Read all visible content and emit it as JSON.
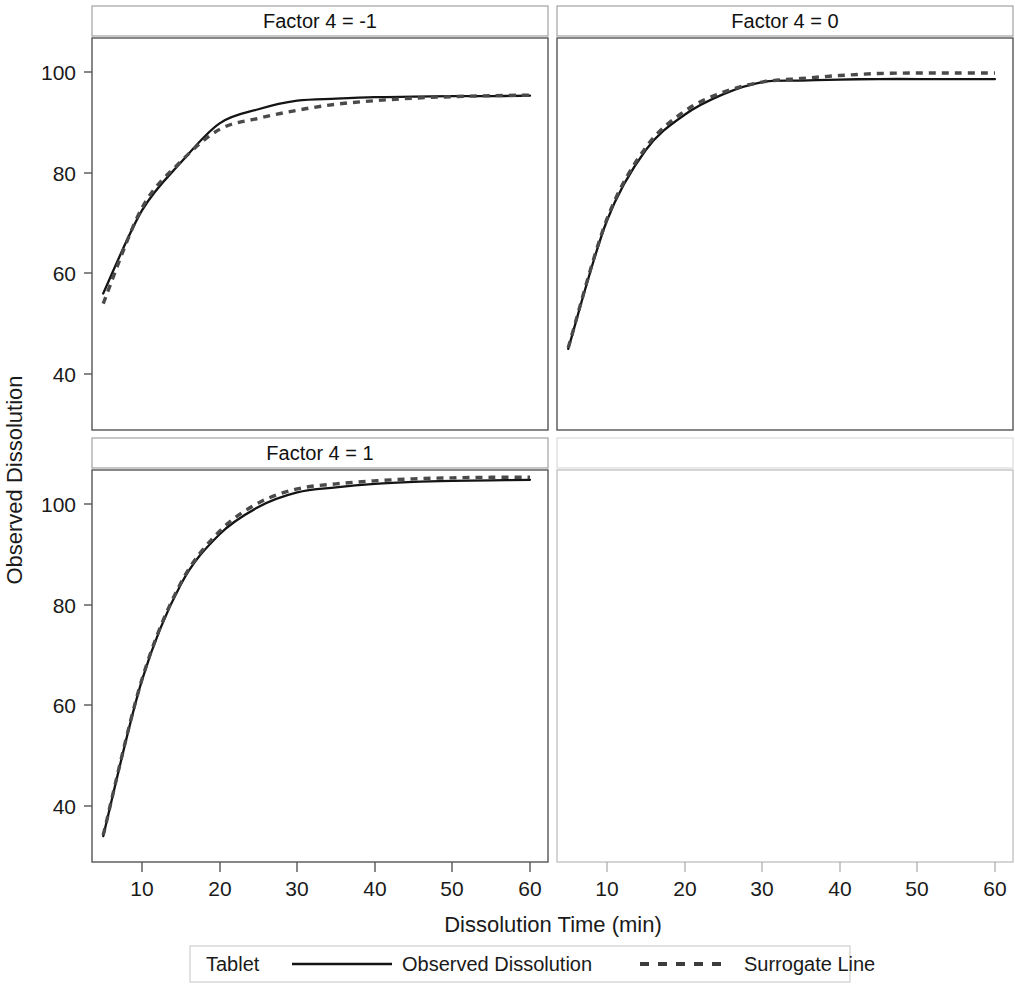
{
  "figure": {
    "ylabel": "Observed Dissolution",
    "xlabel": "Dissolution Time (min)"
  },
  "legend": {
    "group_label": "Tablet",
    "items": [
      {
        "label": "Observed Dissolution",
        "style": "solid",
        "color": "#141414"
      },
      {
        "label": "Surrogate Line",
        "style": "dashed",
        "color": "#4a4a4a"
      }
    ]
  },
  "panels": [
    {
      "title": "Factor 4 = -1",
      "empty": false
    },
    {
      "title": "Factor 4 = 0",
      "empty": false
    },
    {
      "title": "Factor 4 = 1",
      "empty": false
    },
    {
      "title": "",
      "empty": true
    }
  ],
  "chart_data": {
    "type": "line",
    "title": "",
    "xlabel": "Dissolution Time (min)",
    "ylabel": "Observed Dissolution",
    "xlim": [
      3,
      62
    ],
    "ylim": [
      28,
      112
    ],
    "xticks": [
      10,
      20,
      30,
      40,
      50,
      60
    ],
    "yticks": [
      40,
      60,
      80,
      100
    ],
    "grid": false,
    "legend_position": "bottom",
    "facet_variable": "Factor 4",
    "panels": [
      {
        "panel_title": "Factor 4 = -1",
        "facet_value": -1,
        "x": [
          5,
          10,
          15,
          20,
          25,
          30,
          35,
          40,
          45,
          50,
          55,
          60
        ],
        "series": [
          {
            "name": "Observed Dissolution",
            "style": "solid",
            "values": [
              56.0,
              72.5,
              82.0,
              89.8,
              92.6,
              94.3,
              94.7,
              95.0,
              95.1,
              95.2,
              95.2,
              95.3
            ]
          },
          {
            "name": "Surrogate Line",
            "style": "dashed",
            "values": [
              54.0,
              73.0,
              82.2,
              88.6,
              90.8,
              92.4,
              93.6,
              94.3,
              94.8,
              95.1,
              95.3,
              95.4
            ]
          }
        ]
      },
      {
        "panel_title": "Factor 4 = 0",
        "facet_value": 0,
        "x": [
          5,
          10,
          15,
          20,
          25,
          30,
          35,
          40,
          45,
          50,
          55,
          60
        ],
        "series": [
          {
            "name": "Observed Dissolution",
            "style": "solid",
            "values": [
              45.0,
              70.5,
              84.5,
              91.5,
              95.6,
              98.0,
              98.3,
              98.5,
              98.6,
              98.6,
              98.6,
              98.6
            ]
          },
          {
            "name": "Surrogate Line",
            "style": "dashed",
            "values": [
              45.2,
              70.8,
              85.0,
              92.2,
              96.0,
              98.0,
              98.7,
              99.3,
              99.7,
              99.8,
              99.8,
              99.8
            ]
          }
        ]
      },
      {
        "panel_title": "Factor 4 = 1",
        "facet_value": 1,
        "x": [
          5,
          10,
          15,
          20,
          25,
          30,
          35,
          40,
          45,
          50,
          55,
          60
        ],
        "series": [
          {
            "name": "Observed Dissolution",
            "style": "solid",
            "values": [
              34.0,
              65.0,
              84.0,
              94.0,
              99.4,
              102.3,
              103.3,
              104.0,
              104.4,
              104.6,
              104.7,
              104.8
            ]
          },
          {
            "name": "Surrogate Line",
            "style": "dashed",
            "values": [
              34.2,
              65.2,
              84.3,
              94.6,
              100.2,
              103.0,
              104.0,
              104.6,
              105.0,
              105.2,
              105.3,
              105.3
            ]
          }
        ]
      },
      {
        "panel_title": "",
        "facet_value": null,
        "empty": true,
        "x": [],
        "series": []
      }
    ]
  }
}
